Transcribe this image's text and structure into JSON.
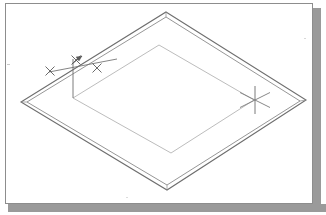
{
  "window": {
    "title": "Isometric CAD drawing",
    "background_color": "#ffffff",
    "frame_border_color": "#8d8d8d",
    "shadow_color": "#9a9a9a"
  },
  "canvas": {
    "background_color": "#ffffff",
    "width": 308,
    "height": 201
  },
  "drawing": {
    "description": "Isometric view of a flat rectangular plate / frame with an inner offset rectangle and a dimension annotation",
    "line_color": "#6e6e6e",
    "thin_line_color": "#b0b0b0",
    "cursor_color": "#7a7a7a",
    "outer_plate": {
      "name": "outer-plate-top-face",
      "label": "Outer plate outline",
      "vertices": [
        {
          "x": 165,
          "y": 11
        },
        {
          "x": 305,
          "y": 99
        },
        {
          "x": 166,
          "y": 189
        },
        {
          "x": 20,
          "y": 101
        }
      ]
    },
    "outer_plate_offset": {
      "name": "outer-plate-thickness-edge",
      "label": "Plate thickness edge (offset band)",
      "offset_px": 4,
      "vertices": [
        {
          "x": 165,
          "y": 16
        },
        {
          "x": 299,
          "y": 100
        },
        {
          "x": 166,
          "y": 184
        },
        {
          "x": 26,
          "y": 101
        }
      ]
    },
    "inner_rectangle": {
      "name": "inner-cutout-rectangle",
      "label": "Inner offset rectangle",
      "vertices": [
        {
          "x": 158,
          "y": 44
        },
        {
          "x": 253,
          "y": 99
        },
        {
          "x": 170,
          "y": 152
        },
        {
          "x": 72,
          "y": 97
        }
      ]
    },
    "dimension": {
      "name": "offset-dimension-annotation",
      "label": "Offset distance dimension",
      "leader_line": {
        "x1": 48,
        "y1": 71,
        "x2": 116,
        "y2": 58
      },
      "extension_line": {
        "x1": 72,
        "y1": 58,
        "x2": 72,
        "y2": 97
      },
      "arrow_head": {
        "x": 78,
        "y": 57,
        "direction": "up-right"
      },
      "tick_marks": [
        {
          "x": 49,
          "y": 70
        },
        {
          "x": 75,
          "y": 59
        },
        {
          "x": 96,
          "y": 67
        }
      ]
    },
    "cursor": {
      "name": "isometric-crosshair-cursor",
      "label": "Isometric crosshair cursor",
      "center": {
        "x": 254,
        "y": 99
      },
      "vertical_span": 28,
      "diagonal_span": 30
    }
  }
}
